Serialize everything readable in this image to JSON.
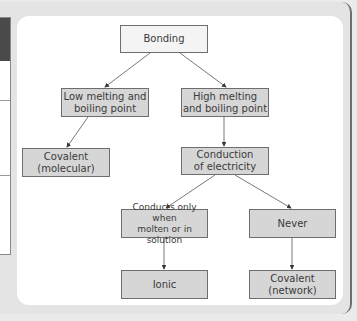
{
  "diagram": {
    "type": "flowchart",
    "title": "Bonding",
    "colors": {
      "node_fill": "#d6d6d6",
      "root_fill": "#f4f4f4",
      "node_border": "#6e6e6e",
      "text": "#3a3a3a",
      "panel": "#ffffff",
      "background": "#e4e4e4"
    },
    "nodes": {
      "bonding": "Bonding",
      "low_mp": "Low melting and boiling point",
      "high_mp": "High melting and boiling point",
      "covalent_molecular": "Covalent (molecular)",
      "conduction": "Conduction of electricity",
      "conducts_molten": "Conducts only when molten or in solution",
      "never": "Never",
      "ionic": "Ionic",
      "covalent_network": "Covalent (network)"
    },
    "node_lines": {
      "low_mp": [
        "Low melting and",
        "boiling point"
      ],
      "high_mp": [
        "High melting",
        "and boiling point"
      ],
      "covalent_molecular": [
        "Covalent",
        "(molecular)"
      ],
      "conduction": [
        "Conduction",
        "of electricity"
      ],
      "conducts_molten": [
        "Conducts only when",
        "molten or in solution"
      ],
      "covalent_network": [
        "Covalent",
        "(network)"
      ]
    },
    "edges": [
      {
        "from": "Bonding",
        "to": "Low melting and boiling point"
      },
      {
        "from": "Bonding",
        "to": "High melting and boiling point"
      },
      {
        "from": "Low melting and boiling point",
        "to": "Covalent (molecular)"
      },
      {
        "from": "High melting and boiling point",
        "to": "Conduction of electricity"
      },
      {
        "from": "Conduction of electricity",
        "to": "Conducts only when molten or in solution"
      },
      {
        "from": "Conduction of electricity",
        "to": "Never"
      },
      {
        "from": "Conducts only when molten or in solution",
        "to": "Ionic"
      },
      {
        "from": "Never",
        "to": "Covalent (network)"
      }
    ]
  }
}
